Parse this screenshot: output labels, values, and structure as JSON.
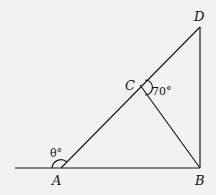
{
  "diagram": {
    "points": {
      "A": {
        "label": "A",
        "x": 61,
        "y": 168
      },
      "B": {
        "label": "B",
        "x": 200,
        "y": 168
      },
      "C": {
        "label": "C",
        "x": 140,
        "y": 85
      },
      "D": {
        "label": "D",
        "x": 200,
        "y": 27
      }
    },
    "angles": {
      "theta": {
        "label": "θ°"
      },
      "c_angle": {
        "label": "70°"
      }
    },
    "colors": {
      "stroke": "#1a1a1a",
      "background": "#f2f2f2"
    }
  }
}
